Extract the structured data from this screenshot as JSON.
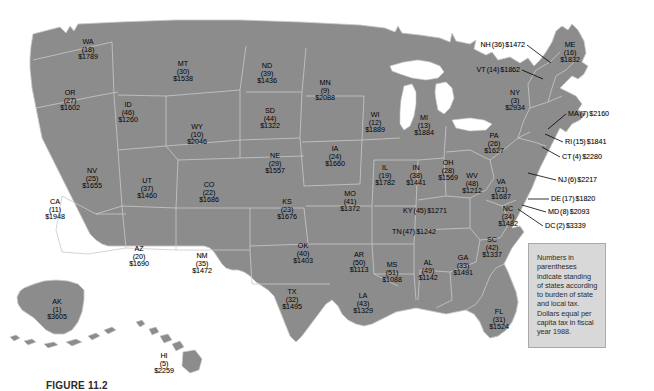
{
  "figure": {
    "caption": "FIGURE 11.2",
    "note": "Numbers in parentheses indicate standing of states according to burden of state and local tax. Dollars equal per capita tax in fiscal year 1988."
  },
  "colors": {
    "land": "#8c8c8c",
    "border": "#c9c9c9",
    "note_bg": "#d8d8d8",
    "note_border": "#a9a9a9",
    "text": "#000000",
    "page_bg": "#ffffff"
  },
  "chart_data": {
    "type": "map",
    "value_label": "Per capita tax (dollars)",
    "rank_label": "Standing of states according to burden of state and local tax",
    "columns": [
      "state",
      "rank",
      "dollars"
    ],
    "states": [
      {
        "abbr": "WA",
        "rank": "(18)",
        "amount": "$1789",
        "x": 88,
        "y": 49,
        "style": "stacked"
      },
      {
        "abbr": "OR",
        "rank": "(27)",
        "amount": "$1602",
        "x": 70,
        "y": 100,
        "style": "stacked"
      },
      {
        "abbr": "ID",
        "rank": "(46)",
        "amount": "$1260",
        "x": 128,
        "y": 112,
        "style": "stacked"
      },
      {
        "abbr": "MT",
        "rank": "(30)",
        "amount": "$1538",
        "x": 183,
        "y": 71,
        "style": "stacked"
      },
      {
        "abbr": "ND",
        "rank": "(39)",
        "amount": "$1436",
        "x": 267,
        "y": 73,
        "style": "stacked"
      },
      {
        "abbr": "MN",
        "rank": "(9)",
        "amount": "$2088",
        "x": 325,
        "y": 90,
        "style": "stacked"
      },
      {
        "abbr": "SD",
        "rank": "(44)",
        "amount": "$1322",
        "x": 270,
        "y": 118,
        "style": "stacked"
      },
      {
        "abbr": "WY",
        "rank": "(10)",
        "amount": "$2046",
        "x": 197,
        "y": 134,
        "style": "stacked"
      },
      {
        "abbr": "WI",
        "rank": "(12)",
        "amount": "$1889",
        "x": 375,
        "y": 122,
        "style": "stacked"
      },
      {
        "abbr": "MI",
        "rank": "(13)",
        "amount": "$1884",
        "x": 424,
        "y": 125,
        "style": "stacked"
      },
      {
        "abbr": "NE",
        "rank": "(29)",
        "amount": "$1557",
        "x": 275,
        "y": 163,
        "style": "stacked"
      },
      {
        "abbr": "IA",
        "rank": "(24)",
        "amount": "$1660",
        "x": 335,
        "y": 156,
        "style": "stacked"
      },
      {
        "abbr": "NV",
        "rank": "(25)",
        "amount": "$1655",
        "x": 92,
        "y": 178,
        "style": "stacked"
      },
      {
        "abbr": "UT",
        "rank": "(37)",
        "amount": "$1460",
        "x": 147,
        "y": 188,
        "style": "stacked"
      },
      {
        "abbr": "CO",
        "rank": "(22)",
        "amount": "$1686",
        "x": 209,
        "y": 192,
        "style": "stacked"
      },
      {
        "abbr": "IL",
        "rank": "(19)",
        "amount": "$1782",
        "x": 385,
        "y": 175,
        "style": "stacked"
      },
      {
        "abbr": "IN",
        "rank": "(38)",
        "amount": "$1441",
        "x": 416,
        "y": 175,
        "style": "stacked"
      },
      {
        "abbr": "OH",
        "rank": "(28)",
        "amount": "$1569",
        "x": 448,
        "y": 170,
        "style": "stacked"
      },
      {
        "abbr": "WV",
        "rank": "(48)",
        "amount": "$1212",
        "x": 472,
        "y": 183,
        "style": "stacked"
      },
      {
        "abbr": "VA",
        "rank": "(21)",
        "amount": "$1687",
        "x": 501,
        "y": 189,
        "style": "stacked"
      },
      {
        "abbr": "CA",
        "rank": "(11)",
        "amount": "$1948",
        "x": 55,
        "y": 209,
        "style": "stacked"
      },
      {
        "abbr": "KS",
        "rank": "(23)",
        "amount": "$1676",
        "x": 287,
        "y": 209,
        "style": "stacked"
      },
      {
        "abbr": "MO",
        "rank": "(41)",
        "amount": "$1372",
        "x": 350,
        "y": 201,
        "style": "stacked"
      },
      {
        "abbr": "NY",
        "rank": "(3)",
        "amount": "$2934",
        "x": 515,
        "y": 100,
        "style": "stacked"
      },
      {
        "abbr": "PA",
        "rank": "(26)",
        "amount": "$1627",
        "x": 494,
        "y": 143,
        "style": "stacked"
      },
      {
        "abbr": "NC",
        "rank": "(34)",
        "amount": "$1482",
        "x": 508,
        "y": 216,
        "style": "stacked"
      },
      {
        "abbr": "SC",
        "rank": "(42)",
        "amount": "$1337",
        "x": 492,
        "y": 247,
        "style": "stacked"
      },
      {
        "abbr": "AZ",
        "rank": "(20)",
        "amount": "$1690",
        "x": 139,
        "y": 256,
        "style": "stacked"
      },
      {
        "abbr": "NM",
        "rank": "(35)",
        "amount": "$1472",
        "x": 202,
        "y": 263,
        "style": "stacked"
      },
      {
        "abbr": "OK",
        "rank": "(40)",
        "amount": "$1403",
        "x": 303,
        "y": 253,
        "style": "stacked"
      },
      {
        "abbr": "AR",
        "rank": "(50)",
        "amount": "$1113",
        "x": 359,
        "y": 262,
        "style": "stacked"
      },
      {
        "abbr": "MS",
        "rank": "(51)",
        "amount": "$1088",
        "x": 392,
        "y": 272,
        "style": "stacked"
      },
      {
        "abbr": "AL",
        "rank": "(49)",
        "amount": "$1142",
        "x": 428,
        "y": 270,
        "style": "stacked"
      },
      {
        "abbr": "GA",
        "rank": "(33)",
        "amount": "$1491",
        "x": 463,
        "y": 265,
        "style": "stacked"
      },
      {
        "abbr": "TX",
        "rank": "(32)",
        "amount": "$1495",
        "x": 292,
        "y": 299,
        "style": "stacked"
      },
      {
        "abbr": "LA",
        "rank": "(43)",
        "amount": "$1329",
        "x": 363,
        "y": 303,
        "style": "stacked"
      },
      {
        "abbr": "FL",
        "rank": "(31)",
        "amount": "$1524",
        "x": 499,
        "y": 319,
        "style": "stacked"
      },
      {
        "abbr": "AK",
        "rank": "(1)",
        "amount": "$3605",
        "x": 57,
        "y": 309,
        "style": "stacked"
      },
      {
        "abbr": "HI",
        "rank": "(5)",
        "amount": "$2259",
        "x": 164,
        "y": 363,
        "style": "stacked"
      },
      {
        "abbr": "ME",
        "rank": "(16)",
        "amount": "$1832",
        "x": 570,
        "y": 52,
        "style": "stacked"
      },
      {
        "abbr": "KY",
        "rank": "(45)",
        "amount": "$1271",
        "x": 425,
        "y": 211,
        "style": "inline"
      },
      {
        "abbr": "TN",
        "rank": "(47)",
        "amount": "$1242",
        "x": 414,
        "y": 232,
        "style": "inline"
      },
      {
        "abbr": "NH",
        "rank": "(36)",
        "amount": "$1472",
        "x": 525,
        "y": 45,
        "style": "callout-right"
      },
      {
        "abbr": "VT",
        "rank": "(14)",
        "amount": "$1862",
        "x": 520,
        "y": 70,
        "style": "callout-right"
      },
      {
        "abbr": "MA",
        "rank": "(7)",
        "amount": "$2160",
        "x": 568,
        "y": 114,
        "style": "callout"
      },
      {
        "abbr": "RI",
        "rank": "(15)",
        "amount": "$1841",
        "x": 565,
        "y": 142,
        "style": "callout"
      },
      {
        "abbr": "CT",
        "rank": "(4)",
        "amount": "$2280",
        "x": 562,
        "y": 157,
        "style": "callout"
      },
      {
        "abbr": "NJ",
        "rank": "(6)",
        "amount": "$2217",
        "x": 558,
        "y": 180,
        "style": "callout"
      },
      {
        "abbr": "DE",
        "rank": "(17)",
        "amount": "$1820",
        "x": 551,
        "y": 199,
        "style": "callout"
      },
      {
        "abbr": "MD",
        "rank": "(8)",
        "amount": "$2093",
        "x": 548,
        "y": 212,
        "style": "callout"
      },
      {
        "abbr": "DC",
        "rank": "(2)",
        "amount": "$3339",
        "x": 545,
        "y": 226,
        "style": "callout"
      }
    ]
  }
}
